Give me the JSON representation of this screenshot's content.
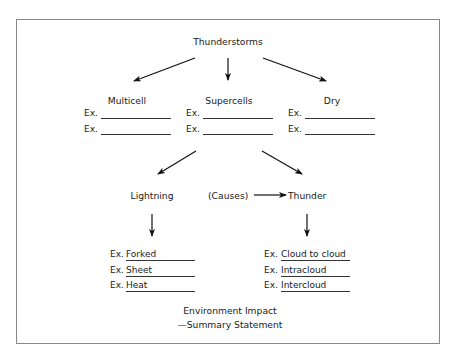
{
  "title": "Thunderstorms",
  "types": [
    {
      "label": "Multicell",
      "examples": [
        "",
        ""
      ]
    },
    {
      "label": "Supercells",
      "examples": [
        "",
        ""
      ]
    },
    {
      "label": "Dry",
      "examples": [
        "",
        ""
      ]
    }
  ],
  "ex_prefix": "Ex.",
  "effects": {
    "lightning": {
      "label": "Lightning",
      "examples": [
        "Forked",
        "Sheet",
        "Heat"
      ]
    },
    "causes_label": "(Causes)",
    "thunder": {
      "label": "Thunder",
      "examples": [
        "Cloud to cloud",
        "Intracloud",
        "Intercloud"
      ]
    }
  },
  "summary": {
    "line1": "Environment Impact",
    "line2": "—Summary Statement"
  }
}
